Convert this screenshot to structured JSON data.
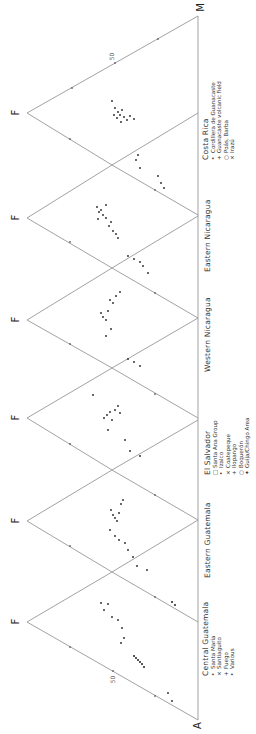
{
  "figure": {
    "type": "AFM ternary diagrams (rotated 90°)",
    "vertex_labels": {
      "A": "A",
      "F": "F",
      "M": "M"
    },
    "tick_label": "50",
    "panels": [
      {
        "title": "Costa Rica",
        "legend": [
          {
            "symbol": "•",
            "label": "Cordillera de Guanacaste"
          },
          {
            "symbol": "+",
            "label": "Guanacaste volcanic field"
          },
          {
            "symbol": "○",
            "label": "Poás, Barba"
          },
          {
            "symbol": "×",
            "label": "Irazú"
          }
        ]
      },
      {
        "title": "Eastern Nicaragua",
        "legend": []
      },
      {
        "title": "Western Nicaragua",
        "legend": []
      },
      {
        "title": "El Salvador",
        "legend": [
          {
            "symbol": "□",
            "label": "Santa Ana Group"
          },
          {
            "symbol": "•",
            "label": "Izalco"
          },
          {
            "symbol": "×",
            "label": "Coatepeque"
          },
          {
            "symbol": "+",
            "label": "Ilopango"
          },
          {
            "symbol": "○",
            "label": "Boquerón"
          },
          {
            "symbol": "✦",
            "label": "Guija/Chingo Area"
          }
        ]
      },
      {
        "title": "Eastern Guatemala",
        "legend": []
      },
      {
        "title": "Central Guatemala",
        "legend": [
          {
            "symbol": "•",
            "label": "Santa María"
          },
          {
            "symbol": "×",
            "label": "Santiaguito"
          },
          {
            "symbol": "+",
            "label": "Fuego"
          },
          {
            "symbol": "•",
            "label": "Various"
          }
        ]
      }
    ]
  },
  "colors": {
    "line": "#8a8a8a",
    "text": "#333333",
    "points": "#222222"
  }
}
